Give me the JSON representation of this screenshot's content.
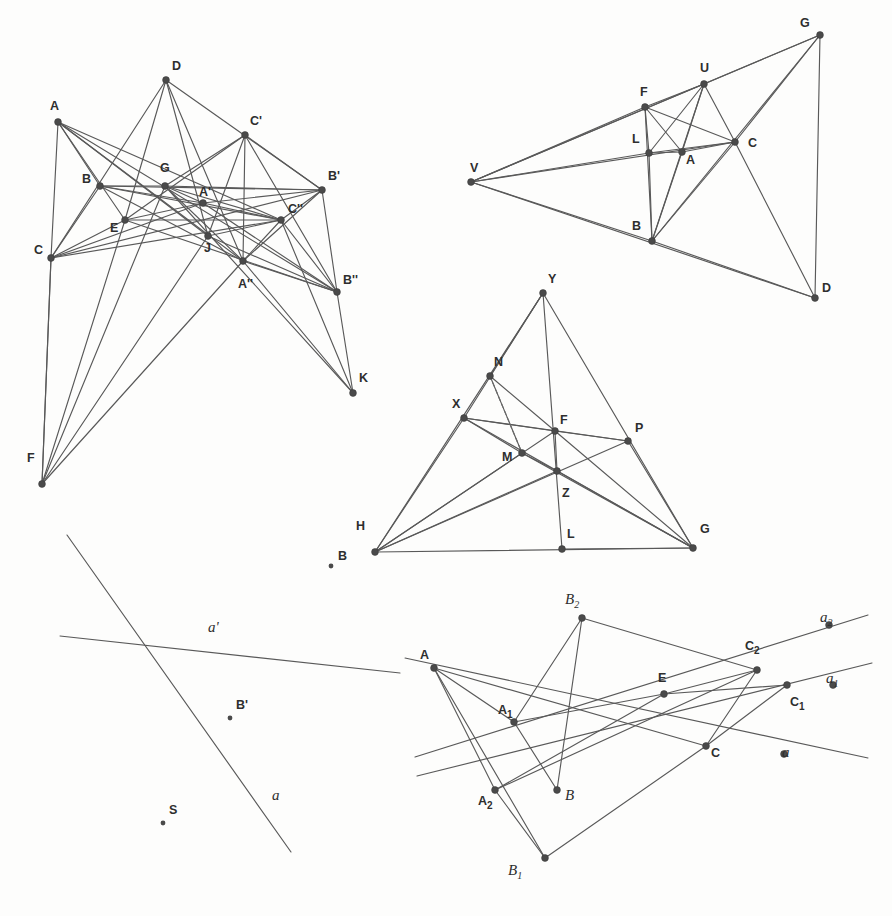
{
  "document": {
    "kind": "geometry-figure-plate",
    "background_color": "#fdfdfc",
    "line_color": "#595959",
    "vertex_color": "#4a4a4a",
    "label_color": "#2e2e2e",
    "width": 892,
    "height": 916
  },
  "figures": [
    {
      "id": "figure-top-left",
      "name": "desargues-configuration-multi-perspective",
      "points": [
        {
          "label": "A",
          "x": 58,
          "y": 122,
          "lx": 50,
          "ly": 110,
          "style": "upright"
        },
        {
          "label": "D",
          "x": 166,
          "y": 80,
          "lx": 172,
          "ly": 70,
          "style": "upright"
        },
        {
          "label": "C'",
          "x": 245,
          "y": 135,
          "lx": 250,
          "ly": 125,
          "style": "upright"
        },
        {
          "label": "B",
          "x": 100,
          "y": 186,
          "lx": 82,
          "ly": 183,
          "style": "upright"
        },
        {
          "label": "G",
          "x": 165,
          "y": 186,
          "lx": 160,
          "ly": 172,
          "style": "upright"
        },
        {
          "label": "B'",
          "x": 322,
          "y": 190,
          "lx": 328,
          "ly": 180,
          "style": "upright"
        },
        {
          "label": "A'",
          "x": 203,
          "y": 203,
          "lx": 199,
          "ly": 196,
          "style": "upright"
        },
        {
          "label": "E",
          "x": 125,
          "y": 220,
          "lx": 110,
          "ly": 232,
          "style": "upright"
        },
        {
          "label": "C''",
          "x": 281,
          "y": 220,
          "lx": 288,
          "ly": 213,
          "style": "upright"
        },
        {
          "label": "J",
          "x": 208,
          "y": 236,
          "lx": 204,
          "ly": 252,
          "style": "upright"
        },
        {
          "label": "C",
          "x": 51,
          "y": 258,
          "lx": 34,
          "ly": 254,
          "style": "upright"
        },
        {
          "label": "A''",
          "x": 243,
          "y": 261,
          "lx": 238,
          "ly": 288,
          "style": "upright"
        },
        {
          "label": "B''",
          "x": 337,
          "y": 292,
          "lx": 343,
          "ly": 284,
          "style": "upright"
        },
        {
          "label": "K",
          "x": 353,
          "y": 393,
          "lx": 359,
          "ly": 382,
          "style": "upright"
        },
        {
          "label": "F",
          "x": 42,
          "y": 484,
          "lx": 27,
          "ly": 462,
          "style": "upright"
        }
      ],
      "segments": [
        [
          "A",
          "C"
        ],
        [
          "A",
          "B"
        ],
        [
          "A",
          "E"
        ],
        [
          "A",
          "J"
        ],
        [
          "A",
          "A''"
        ],
        [
          "A",
          "C''"
        ],
        [
          "A",
          "B''"
        ],
        [
          "B",
          "C"
        ],
        [
          "B",
          "G"
        ],
        [
          "B",
          "A'"
        ],
        [
          "B",
          "B'"
        ],
        [
          "B",
          "C''"
        ],
        [
          "B",
          "A''"
        ],
        [
          "C",
          "E"
        ],
        [
          "C",
          "A'"
        ],
        [
          "C",
          "C''"
        ],
        [
          "C",
          "B'"
        ],
        [
          "C",
          "F"
        ],
        [
          "D",
          "E"
        ],
        [
          "D",
          "C"
        ],
        [
          "D",
          "B'"
        ],
        [
          "D",
          "A''"
        ],
        [
          "D",
          "J"
        ],
        [
          "C'",
          "E"
        ],
        [
          "C'",
          "B'"
        ],
        [
          "C'",
          "A''"
        ],
        [
          "C'",
          "J"
        ],
        [
          "C'",
          "B''"
        ],
        [
          "C'",
          "G"
        ],
        [
          "G",
          "A'"
        ],
        [
          "G",
          "B'"
        ],
        [
          "G",
          "C''"
        ],
        [
          "G",
          "A''"
        ],
        [
          "G",
          "K"
        ],
        [
          "A'",
          "C''"
        ],
        [
          "A'",
          "B'"
        ],
        [
          "A'",
          "B''"
        ],
        [
          "E",
          "A'"
        ],
        [
          "E",
          "C''"
        ],
        [
          "E",
          "B''"
        ],
        [
          "J",
          "C''"
        ],
        [
          "J",
          "B''"
        ],
        [
          "A''",
          "C''"
        ],
        [
          "A''",
          "B''"
        ],
        [
          "A''",
          "K"
        ],
        [
          "A''",
          "B'"
        ],
        [
          "C''",
          "B'"
        ],
        [
          "C''",
          "B''"
        ],
        [
          "C''",
          "K"
        ],
        [
          "B'",
          "B''"
        ],
        [
          "B''",
          "K"
        ],
        [
          "F",
          "C"
        ],
        [
          "F",
          "E"
        ],
        [
          "F",
          "G"
        ],
        [
          "F",
          "A''"
        ],
        [
          "F",
          "J"
        ]
      ]
    },
    {
      "id": "figure-top-right",
      "name": "perspective-triangles-with-vertex-V",
      "points": [
        {
          "label": "G",
          "x": 820,
          "y": 35,
          "lx": 800,
          "ly": 27,
          "style": "upright"
        },
        {
          "label": "U",
          "x": 704,
          "y": 84,
          "lx": 700,
          "ly": 72,
          "style": "upright"
        },
        {
          "label": "F",
          "x": 645,
          "y": 107,
          "lx": 640,
          "ly": 96,
          "style": "upright"
        },
        {
          "label": "L",
          "x": 649,
          "y": 153,
          "lx": 632,
          "ly": 143,
          "style": "upright"
        },
        {
          "label": "A",
          "x": 682,
          "y": 152,
          "lx": 686,
          "ly": 164,
          "style": "upright"
        },
        {
          "label": "C",
          "x": 735,
          "y": 142,
          "lx": 748,
          "ly": 147,
          "style": "upright"
        },
        {
          "label": "V",
          "x": 471,
          "y": 182,
          "lx": 470,
          "ly": 172,
          "style": "upright"
        },
        {
          "label": "B",
          "x": 652,
          "y": 241,
          "lx": 632,
          "ly": 230,
          "style": "upright"
        },
        {
          "label": "D",
          "x": 815,
          "y": 298,
          "lx": 822,
          "ly": 292,
          "style": "upright"
        }
      ],
      "segments": [
        [
          "V",
          "F"
        ],
        [
          "V",
          "U"
        ],
        [
          "V",
          "G"
        ],
        [
          "V",
          "L"
        ],
        [
          "V",
          "C"
        ],
        [
          "V",
          "B"
        ],
        [
          "V",
          "D"
        ],
        [
          "F",
          "U"
        ],
        [
          "F",
          "L"
        ],
        [
          "F",
          "B"
        ],
        [
          "F",
          "C"
        ],
        [
          "F",
          "A"
        ],
        [
          "U",
          "G"
        ],
        [
          "U",
          "A"
        ],
        [
          "U",
          "C"
        ],
        [
          "U",
          "B"
        ],
        [
          "U",
          "L"
        ],
        [
          "L",
          "A"
        ],
        [
          "L",
          "C"
        ],
        [
          "L",
          "B"
        ],
        [
          "A",
          "C"
        ],
        [
          "A",
          "B"
        ],
        [
          "C",
          "B"
        ],
        [
          "C",
          "G"
        ],
        [
          "C",
          "D"
        ],
        [
          "B",
          "G"
        ],
        [
          "B",
          "D"
        ],
        [
          "G",
          "D"
        ]
      ]
    },
    {
      "id": "figure-middle",
      "name": "triangle-cevian-configuration",
      "points": [
        {
          "label": "Y",
          "x": 543,
          "y": 293,
          "lx": 548,
          "ly": 283,
          "style": "upright"
        },
        {
          "label": "N",
          "x": 490,
          "y": 376,
          "lx": 494,
          "ly": 366,
          "style": "upright"
        },
        {
          "label": "X",
          "x": 464,
          "y": 418,
          "lx": 452,
          "ly": 408,
          "style": "upright"
        },
        {
          "label": "F",
          "x": 555,
          "y": 431,
          "lx": 560,
          "ly": 424,
          "style": "upright"
        },
        {
          "label": "P",
          "x": 628,
          "y": 441,
          "lx": 635,
          "ly": 432,
          "style": "upright"
        },
        {
          "label": "M",
          "x": 522,
          "y": 453,
          "lx": 502,
          "ly": 461,
          "style": "upright"
        },
        {
          "label": "Z",
          "x": 557,
          "y": 471,
          "lx": 562,
          "ly": 497,
          "style": "upright"
        },
        {
          "label": "H",
          "x": 375,
          "y": 552,
          "lx": 356,
          "ly": 530,
          "style": "upright"
        },
        {
          "label": "L",
          "x": 562,
          "y": 549,
          "lx": 567,
          "ly": 538,
          "style": "upright"
        },
        {
          "label": "G",
          "x": 693,
          "y": 548,
          "lx": 700,
          "ly": 533,
          "style": "upright"
        }
      ],
      "segments": [
        [
          "Y",
          "H"
        ],
        [
          "Y",
          "G"
        ],
        [
          "Y",
          "L"
        ],
        [
          "Y",
          "N"
        ],
        [
          "Y",
          "X"
        ],
        [
          "X",
          "H"
        ],
        [
          "X",
          "F"
        ],
        [
          "X",
          "P"
        ],
        [
          "X",
          "G"
        ],
        [
          "X",
          "M"
        ],
        [
          "N",
          "F"
        ],
        [
          "N",
          "M"
        ],
        [
          "H",
          "F"
        ],
        [
          "H",
          "P"
        ],
        [
          "H",
          "G"
        ],
        [
          "H",
          "M"
        ],
        [
          "H",
          "Z"
        ],
        [
          "F",
          "P"
        ],
        [
          "F",
          "G"
        ],
        [
          "F",
          "Z"
        ],
        [
          "M",
          "G"
        ],
        [
          "M",
          "Z"
        ],
        [
          "P",
          "G"
        ],
        [
          "Z",
          "G"
        ],
        [
          "L",
          "G"
        ]
      ],
      "dashed_segments": [
        [
          "N",
          "M"
        ]
      ],
      "stray_points": [
        {
          "label": "B",
          "x": 331,
          "y": 566,
          "lx": 338,
          "ly": 560,
          "style": "upright",
          "small": true
        }
      ]
    },
    {
      "id": "figure-bottom-left",
      "name": "two-lines-with-points-a-aprime",
      "lines": [
        {
          "label": "a",
          "x1": 67,
          "y1": 535,
          "x2": 291,
          "y2": 852,
          "lx": 272,
          "ly": 800,
          "style": "italic"
        },
        {
          "label": "a'",
          "x1": 60,
          "y1": 636,
          "x2": 400,
          "y2": 673,
          "lx": 208,
          "ly": 632,
          "style": "italic-prime"
        }
      ],
      "points": [
        {
          "label": "B'",
          "x": 230,
          "y": 718,
          "lx": 236,
          "ly": 709,
          "style": "upright",
          "small": true
        },
        {
          "label": "S",
          "x": 163,
          "y": 823,
          "lx": 169,
          "ly": 814,
          "style": "upright",
          "small": true
        }
      ]
    },
    {
      "id": "figure-bottom-right",
      "name": "projective-perspectivity-configuration",
      "points": [
        {
          "label": "B_2",
          "sub": "2",
          "base": "B",
          "x": 582,
          "y": 618,
          "lx": 565,
          "ly": 604,
          "style": "italic-sub"
        },
        {
          "label": "a_2",
          "sub": "2",
          "base": "a",
          "x": 829,
          "y": 625,
          "lx": 820,
          "ly": 622,
          "style": "italic-sub"
        },
        {
          "label": "C_2",
          "sub": "2",
          "base": "C",
          "x": 757,
          "y": 670,
          "lx": 745,
          "ly": 650,
          "style": "upright-sub"
        },
        {
          "label": "A",
          "x": 434,
          "y": 668,
          "lx": 420,
          "ly": 659,
          "style": "upright"
        },
        {
          "label": "a_1",
          "sub": "1",
          "base": "a",
          "x": 833,
          "y": 685,
          "lx": 826,
          "ly": 683,
          "style": "italic-sub"
        },
        {
          "label": "E",
          "x": 664,
          "y": 694,
          "lx": 658,
          "ly": 682,
          "style": "upright"
        },
        {
          "label": "C_1",
          "sub": "1",
          "base": "C",
          "x": 787,
          "y": 685,
          "lx": 790,
          "ly": 706,
          "style": "upright-sub"
        },
        {
          "label": "A_1",
          "sub": "1",
          "base": "A",
          "x": 514,
          "y": 722,
          "lx": 498,
          "ly": 714,
          "style": "upright-sub"
        },
        {
          "label": "C",
          "x": 706,
          "y": 746,
          "lx": 711,
          "ly": 757,
          "style": "upright"
        },
        {
          "label": "a",
          "x": 784,
          "y": 754,
          "lx": 782,
          "ly": 757,
          "style": "italic"
        },
        {
          "label": "A_2",
          "sub": "2",
          "base": "A",
          "x": 495,
          "y": 790,
          "lx": 478,
          "ly": 805,
          "style": "upright-sub"
        },
        {
          "label": "B",
          "x": 557,
          "y": 790,
          "lx": 565,
          "ly": 800,
          "style": "italic"
        },
        {
          "label": "B_1",
          "sub": "1",
          "base": "B",
          "x": 545,
          "y": 858,
          "lx": 508,
          "ly": 875,
          "style": "italic-sub"
        }
      ],
      "segments": [
        [
          "A",
          "C"
        ],
        [
          "A",
          "A_1"
        ],
        [
          "A",
          "A_2"
        ],
        [
          "A",
          "B_1"
        ],
        [
          "A_1",
          "E"
        ],
        [
          "A_1",
          "B"
        ],
        [
          "A_1",
          "B_2"
        ],
        [
          "A_2",
          "E"
        ],
        [
          "A_2",
          "C_2"
        ],
        [
          "A_2",
          "B_1"
        ],
        [
          "B_2",
          "C_2"
        ],
        [
          "B_2",
          "B"
        ],
        [
          "C",
          "C_2"
        ],
        [
          "C",
          "C_1"
        ],
        [
          "C",
          "B_1"
        ],
        [
          "E",
          "C_1"
        ],
        [
          "E",
          "C_2"
        ]
      ],
      "open_lines": [
        {
          "name": "line-a",
          "x1": 405,
          "y1": 658,
          "x2": 868,
          "y2": 758
        },
        {
          "name": "line-a1",
          "x1": 417,
          "y1": 776,
          "x2": 872,
          "y2": 663
        },
        {
          "name": "line-a2",
          "x1": 415,
          "y1": 757,
          "x2": 868,
          "y2": 615
        }
      ]
    }
  ]
}
